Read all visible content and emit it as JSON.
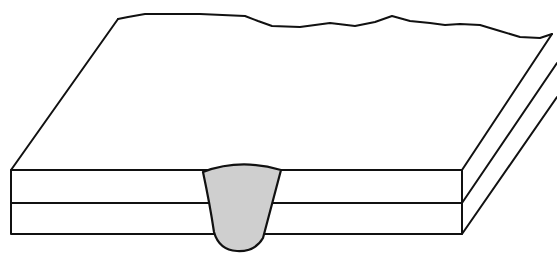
{
  "figure": {
    "components": {
      "top_plate": "upper plate",
      "bottom_plate": "lower plate",
      "weld_nugget": "weld nugget"
    },
    "colors": {
      "line": "#111111",
      "nugget_fill": "#cfcfcf",
      "background": "#ffffff"
    }
  }
}
